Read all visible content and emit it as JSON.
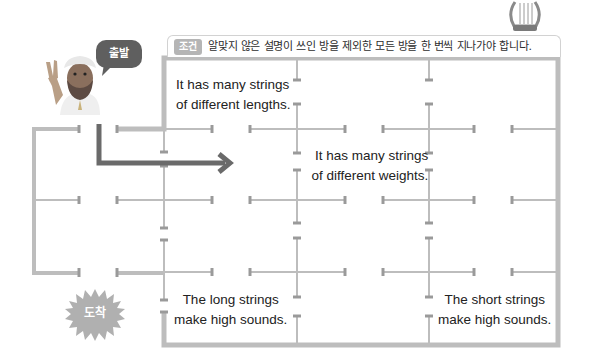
{
  "condition": {
    "tag": "조건",
    "text": "알맞지 않은 설명이 쓰인 방을 제외한 모든 방을 한 번씩 지나가야 합니다."
  },
  "start_bubble": {
    "label": "출발"
  },
  "arrive_badge": {
    "label": "도착"
  },
  "rooms": [
    {
      "id": "room-top-left",
      "lines": [
        "It has many strings",
        "of different lengths."
      ]
    },
    {
      "id": "room-middle",
      "lines": [
        "It has many strings",
        "of different weights."
      ]
    },
    {
      "id": "room-bottom-left",
      "lines": [
        "The long strings",
        "make high sounds."
      ]
    },
    {
      "id": "room-bottom-right",
      "lines": [
        "The short strings",
        "make high sounds."
      ]
    }
  ],
  "icons": {
    "character": "musician-character-icon",
    "instrument": "lyre-icon",
    "path_arrow": "arrow-right-icon"
  },
  "colors": {
    "wall": "#bdbdbd",
    "arrow": "#6a6a6a",
    "bubble": "#5f5f5f",
    "badge": "#b0b0b0",
    "tag": "#b5b5b5"
  }
}
